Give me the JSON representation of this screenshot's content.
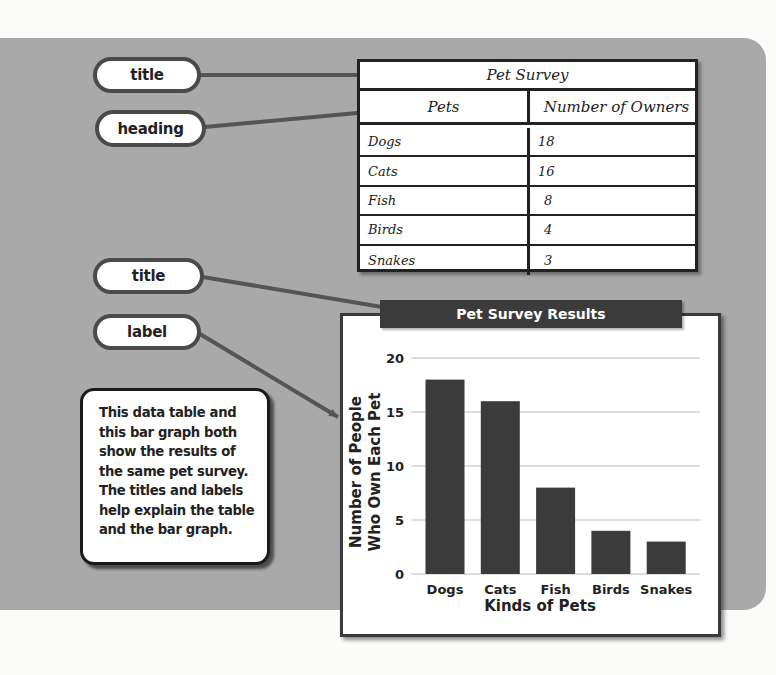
{
  "callouts": {
    "table_title": "title",
    "table_heading": "heading",
    "chart_title": "title",
    "chart_label": "label"
  },
  "table": {
    "title": "Pet Survey",
    "headers": [
      "Pets",
      "Number of Owners"
    ],
    "rows": [
      {
        "pet": "Dogs",
        "owners": "18"
      },
      {
        "pet": "Cats",
        "owners": "16"
      },
      {
        "pet": "Fish",
        "owners": "8"
      },
      {
        "pet": "Birds",
        "owners": "4"
      },
      {
        "pet": "Snakes",
        "owners": "3"
      }
    ]
  },
  "info_text": "This data table and this bar graph both show the results of the same pet survey. The titles and labels help explain the table and the bar graph.",
  "colors": {
    "panel": "#a9a9a9",
    "bar": "#3b3b3b",
    "connector": "#555555",
    "banner": "#3b3b3b"
  },
  "chart_data": {
    "type": "bar",
    "title": "Pet Survey Results",
    "xlabel": "Kinds of Pets",
    "ylabel_lines": [
      "Number of People",
      "Who Own Each Pet"
    ],
    "ylabel": "Number of People Who Own Each Pet",
    "categories": [
      "Dogs",
      "Cats",
      "Fish",
      "Birds",
      "Snakes"
    ],
    "values": [
      18,
      16,
      8,
      4,
      3
    ],
    "ylim": [
      0,
      20
    ],
    "yticks": [
      0,
      5,
      10,
      15,
      20
    ],
    "grid": true,
    "legend": "none"
  }
}
